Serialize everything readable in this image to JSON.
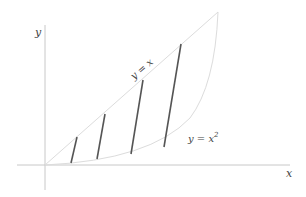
{
  "diagram": {
    "title": "",
    "axes": {
      "x_label": "x",
      "y_label": "y"
    },
    "curves": [
      {
        "name": "line",
        "label": "y = x",
        "equation": "y = x"
      },
      {
        "name": "parabola",
        "label": "y = x",
        "label_sup": "2",
        "equation": "y = x^2"
      }
    ],
    "segments_count": 4,
    "colors": {
      "axis": "#c8c8c8",
      "curve": "#d4d4d4",
      "segment": "#555555",
      "label": "#444444"
    }
  }
}
